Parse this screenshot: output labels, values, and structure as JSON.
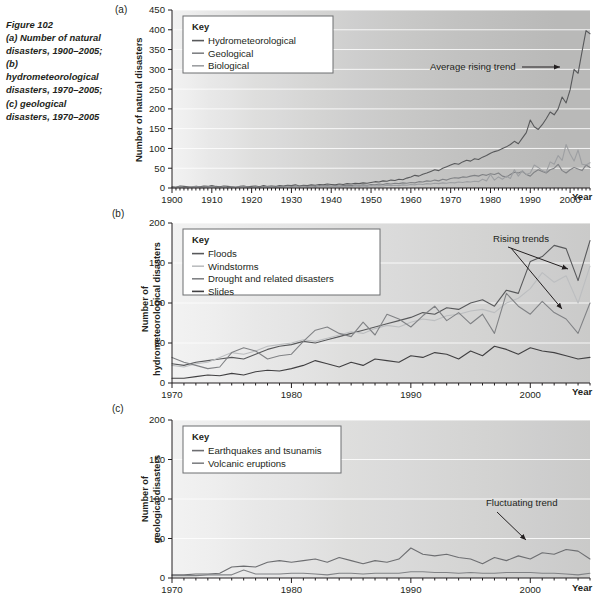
{
  "figure": {
    "label": "Figure 102",
    "caption": "(a) Number of natural disasters, 1900–2005; (b) hydrometeorological disasters, 1970–2005; (c) geological disasters, 1970–2005"
  },
  "panels": {
    "a": {
      "letter": "(a)",
      "key_title": "Key",
      "ylabel": "Number of natural disasters",
      "xlabel": "Year"
    },
    "b": {
      "letter": "(b)",
      "key_title": "Key",
      "ylabel_line1": "Number of",
      "ylabel_line2": "hydrometeorological disasters",
      "xlabel": "Year"
    },
    "c": {
      "letter": "(c)",
      "key_title": "Key",
      "ylabel_line1": "Number of",
      "ylabel_line2": "geological disasters",
      "xlabel": "Year"
    }
  },
  "colors": {
    "biological": "#9d9fa2",
    "geological": "#808285",
    "hydrometeorological": "#58595b",
    "floods": "#58595b",
    "windstorms": "#bcbec0",
    "drought": "#808285",
    "slides": "#414042",
    "earthquakes": "#6d6e71",
    "volcanic": "#808285",
    "axis": "#231f20",
    "grid": "#ffffff",
    "key_border": "#6d6e71"
  },
  "chart_data": [
    {
      "id": "a",
      "type": "line",
      "title": "(a) Number of natural disasters, 1900–2005",
      "xlabel": "Year",
      "ylabel": "Number of natural disasters",
      "xlim": [
        1900,
        2005
      ],
      "ylim": [
        0,
        450
      ],
      "yticks": [
        0,
        50,
        100,
        150,
        200,
        250,
        300,
        350,
        400,
        450
      ],
      "xticks": [
        1900,
        1910,
        1920,
        1930,
        1940,
        1950,
        1960,
        1970,
        1980,
        1990,
        2000
      ],
      "grid": true,
      "legend_position": "top-left",
      "annotations": [
        {
          "text": "Average rising trend",
          "x": 1978,
          "y": 330
        }
      ],
      "x": [
        1900,
        1901,
        1902,
        1903,
        1904,
        1905,
        1906,
        1907,
        1908,
        1909,
        1910,
        1911,
        1912,
        1913,
        1914,
        1915,
        1916,
        1917,
        1918,
        1919,
        1920,
        1921,
        1922,
        1923,
        1924,
        1925,
        1926,
        1927,
        1928,
        1929,
        1930,
        1931,
        1932,
        1933,
        1934,
        1935,
        1936,
        1937,
        1938,
        1939,
        1940,
        1941,
        1942,
        1943,
        1944,
        1945,
        1946,
        1947,
        1948,
        1949,
        1950,
        1951,
        1952,
        1953,
        1954,
        1955,
        1956,
        1957,
        1958,
        1959,
        1960,
        1961,
        1962,
        1963,
        1964,
        1965,
        1966,
        1967,
        1968,
        1969,
        1970,
        1971,
        1972,
        1973,
        1974,
        1975,
        1976,
        1977,
        1978,
        1979,
        1980,
        1981,
        1982,
        1983,
        1984,
        1985,
        1986,
        1987,
        1988,
        1989,
        1990,
        1991,
        1992,
        1993,
        1994,
        1995,
        1996,
        1997,
        1998,
        1999,
        2000,
        2001,
        2002,
        2003,
        2004,
        2005
      ],
      "series": [
        {
          "name": "Hydrometeorological",
          "color": "#58595b",
          "values": [
            3,
            2,
            5,
            4,
            3,
            2,
            4,
            3,
            5,
            4,
            6,
            4,
            3,
            5,
            4,
            3,
            2,
            4,
            5,
            3,
            4,
            5,
            3,
            6,
            4,
            5,
            4,
            6,
            5,
            7,
            6,
            8,
            5,
            7,
            6,
            8,
            7,
            9,
            8,
            10,
            9,
            8,
            10,
            9,
            11,
            10,
            12,
            11,
            13,
            12,
            14,
            16,
            15,
            18,
            17,
            20,
            19,
            22,
            21,
            25,
            28,
            32,
            30,
            35,
            38,
            42,
            46,
            44,
            50,
            54,
            58,
            62,
            60,
            66,
            70,
            68,
            74,
            72,
            78,
            82,
            88,
            92,
            95,
            100,
            104,
            110,
            118,
            112,
            126,
            140,
            172,
            155,
            148,
            160,
            175,
            192,
            185,
            200,
            230,
            215,
            248,
            300,
            290,
            345,
            398,
            390
          ]
        },
        {
          "name": "Geological",
          "color": "#808285",
          "values": [
            2,
            2,
            3,
            2,
            2,
            3,
            4,
            3,
            2,
            3,
            4,
            3,
            2,
            3,
            2,
            3,
            2,
            3,
            4,
            3,
            2,
            3,
            2,
            4,
            3,
            4,
            3,
            4,
            3,
            5,
            4,
            5,
            4,
            5,
            4,
            5,
            4,
            6,
            5,
            6,
            5,
            6,
            5,
            6,
            7,
            6,
            8,
            7,
            8,
            7,
            9,
            8,
            10,
            9,
            11,
            10,
            12,
            11,
            13,
            12,
            14,
            13,
            16,
            15,
            18,
            17,
            20,
            18,
            22,
            20,
            24,
            26,
            25,
            28,
            27,
            30,
            32,
            30,
            34,
            32,
            36,
            34,
            38,
            30,
            28,
            34,
            40,
            38,
            42,
            34,
            30,
            40,
            46,
            42,
            38,
            46,
            50,
            60,
            44,
            38,
            46,
            52,
            48,
            44,
            58,
            52
          ]
        },
        {
          "name": "Biological",
          "color": "#9d9fa2",
          "values": [
            1,
            1,
            2,
            1,
            1,
            2,
            2,
            1,
            1,
            2,
            2,
            1,
            1,
            2,
            1,
            2,
            1,
            2,
            2,
            1,
            1,
            2,
            1,
            2,
            2,
            2,
            1,
            2,
            2,
            3,
            2,
            3,
            2,
            3,
            2,
            3,
            2,
            3,
            3,
            4,
            3,
            3,
            4,
            3,
            4,
            3,
            5,
            4,
            5,
            4,
            6,
            5,
            6,
            5,
            7,
            6,
            7,
            6,
            8,
            7,
            9,
            8,
            10,
            9,
            11,
            10,
            12,
            11,
            13,
            12,
            14,
            13,
            15,
            14,
            16,
            15,
            17,
            16,
            22,
            18,
            34,
            20,
            28,
            22,
            30,
            24,
            46,
            30,
            44,
            34,
            38,
            58,
            52,
            44,
            40,
            66,
            60,
            82,
            70,
            110,
            86,
            68,
            96,
            60,
            58,
            64
          ]
        }
      ]
    },
    {
      "id": "b",
      "type": "line",
      "title": "(b) Number of hydrometeorological disasters, 1970–2005",
      "xlabel": "Year",
      "ylabel": "Number of hydrometeorological disasters",
      "xlim": [
        1970,
        2005
      ],
      "ylim": [
        0,
        200
      ],
      "yticks": [
        0,
        50,
        100,
        150,
        200
      ],
      "xticks": [
        1970,
        1980,
        1990,
        2000
      ],
      "grid": true,
      "legend_position": "top-left",
      "annotations": [
        {
          "text": "Rising trends",
          "x": 1996,
          "y": 182
        }
      ],
      "x": [
        1970,
        1971,
        1972,
        1973,
        1974,
        1975,
        1976,
        1977,
        1978,
        1979,
        1980,
        1981,
        1982,
        1983,
        1984,
        1985,
        1986,
        1987,
        1988,
        1989,
        1990,
        1991,
        1992,
        1993,
        1994,
        1995,
        1996,
        1997,
        1998,
        1999,
        2000,
        2001,
        2002,
        2003,
        2004,
        2005
      ],
      "series": [
        {
          "name": "Floods",
          "color": "#58595b",
          "values": [
            24,
            22,
            26,
            28,
            30,
            32,
            30,
            36,
            42,
            46,
            48,
            52,
            50,
            54,
            58,
            62,
            66,
            70,
            74,
            78,
            82,
            88,
            86,
            94,
            92,
            100,
            104,
            96,
            116,
            112,
            152,
            158,
            172,
            168,
            128,
            178
          ]
        },
        {
          "name": "Windstorms",
          "color": "#bcbec0",
          "values": [
            22,
            20,
            24,
            26,
            32,
            38,
            36,
            40,
            46,
            48,
            50,
            54,
            52,
            56,
            60,
            64,
            62,
            68,
            72,
            70,
            76,
            80,
            78,
            84,
            86,
            90,
            92,
            88,
            100,
            106,
            118,
            138,
            126,
            134,
            100,
            146
          ]
        },
        {
          "name": "Drought and related disasters",
          "color": "#808285",
          "values": [
            32,
            26,
            22,
            18,
            20,
            38,
            44,
            40,
            30,
            34,
            36,
            52,
            66,
            70,
            62,
            58,
            76,
            60,
            86,
            80,
            70,
            84,
            96,
            78,
            88,
            74,
            86,
            62,
            112,
            96,
            86,
            102,
            88,
            80,
            62,
            100
          ]
        },
        {
          "name": "Slides",
          "color": "#414042",
          "values": [
            6,
            6,
            8,
            10,
            9,
            12,
            10,
            14,
            16,
            15,
            18,
            22,
            28,
            24,
            20,
            26,
            22,
            30,
            28,
            26,
            34,
            32,
            38,
            36,
            30,
            40,
            34,
            46,
            42,
            36,
            44,
            40,
            38,
            34,
            30,
            32
          ]
        }
      ]
    },
    {
      "id": "c",
      "type": "line",
      "title": "(c) Number of geological disasters, 1970–2005",
      "xlabel": "Year",
      "ylabel": "Number of geological disasters",
      "xlim": [
        1970,
        2005
      ],
      "ylim": [
        0,
        200
      ],
      "yticks": [
        0,
        50,
        100,
        150,
        200
      ],
      "xticks": [
        1970,
        1980,
        1990,
        2000
      ],
      "grid": true,
      "legend_position": "top-left",
      "annotations": [
        {
          "text": "Fluctuating trend",
          "x": 1998,
          "y": 86
        }
      ],
      "x": [
        1970,
        1971,
        1972,
        1973,
        1974,
        1975,
        1976,
        1977,
        1978,
        1979,
        1980,
        1981,
        1982,
        1983,
        1984,
        1985,
        1986,
        1987,
        1988,
        1989,
        1990,
        1991,
        1992,
        1993,
        1994,
        1995,
        1996,
        1997,
        1998,
        1999,
        2000,
        2001,
        2002,
        2003,
        2004,
        2005
      ],
      "series": [
        {
          "name": "Earthquakes and tsunamis",
          "color": "#6d6e71",
          "values": [
            4,
            4,
            5,
            5,
            6,
            14,
            15,
            14,
            20,
            22,
            20,
            22,
            24,
            20,
            26,
            22,
            18,
            22,
            20,
            24,
            38,
            30,
            28,
            30,
            26,
            24,
            18,
            26,
            22,
            28,
            24,
            32,
            30,
            36,
            34,
            24
          ]
        },
        {
          "name": "Volcanic eruptions",
          "color": "#808285",
          "values": [
            3,
            3,
            3,
            4,
            4,
            4,
            10,
            5,
            5,
            5,
            6,
            6,
            5,
            4,
            6,
            6,
            5,
            6,
            6,
            6,
            8,
            8,
            7,
            7,
            6,
            7,
            6,
            6,
            7,
            7,
            7,
            6,
            6,
            5,
            4,
            6
          ]
        }
      ]
    }
  ],
  "background_bands": {
    "a": [
      0.0,
      0.04,
      0.09,
      0.14,
      0.2,
      0.26,
      0.32,
      0.38,
      0.44,
      0.52,
      0.6,
      0.68,
      0.76,
      0.84,
      0.92
    ],
    "b": [
      0.0,
      0.1,
      0.2,
      0.3,
      0.42,
      0.54,
      0.66,
      0.78,
      0.88
    ],
    "c": [
      0.0,
      0.1,
      0.2,
      0.3,
      0.42,
      0.54,
      0.66,
      0.78,
      0.88
    ]
  }
}
